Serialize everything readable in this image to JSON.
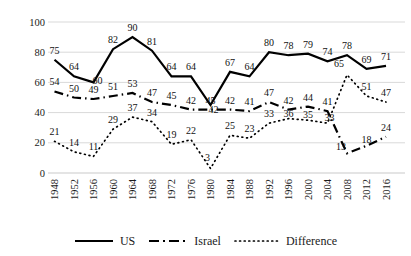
{
  "chart_data": {
    "type": "line",
    "title": "",
    "xlabel": "",
    "ylabel": "",
    "categories": [
      "1948",
      "1952",
      "1956",
      "1960",
      "1964",
      "1968",
      "1972",
      "1976",
      "1980",
      "1984",
      "1988",
      "1992",
      "1996",
      "2000",
      "2004",
      "2008",
      "2012",
      "2016"
    ],
    "series": [
      {
        "name": "US",
        "style": "solid",
        "values": [
          75,
          64,
          60,
          82,
          90,
          81,
          64,
          64,
          45,
          67,
          64,
          80,
          78,
          79,
          74,
          78,
          69,
          71
        ]
      },
      {
        "name": "Israel",
        "style": "dashdot",
        "values": [
          54,
          50,
          49,
          51,
          53,
          47,
          45,
          42,
          42,
          42,
          41,
          47,
          42,
          44,
          41,
          13,
          18,
          24
        ]
      },
      {
        "name": "Difference",
        "style": "dotted",
        "values": [
          21,
          14,
          11,
          29,
          37,
          34,
          19,
          22,
          3,
          25,
          23,
          33,
          36,
          35,
          33,
          65,
          51,
          47
        ]
      }
    ],
    "ylim": [
      0,
      100
    ],
    "yticks": [
      0,
      20,
      40,
      60,
      80,
      100
    ],
    "grid": "horizontal",
    "point_labels": true,
    "legend_position": "bottom"
  },
  "colors": {
    "line": "#000000",
    "gridline": "#d9d9d9",
    "text": "#1a1a1a",
    "background": "#ffffff"
  }
}
